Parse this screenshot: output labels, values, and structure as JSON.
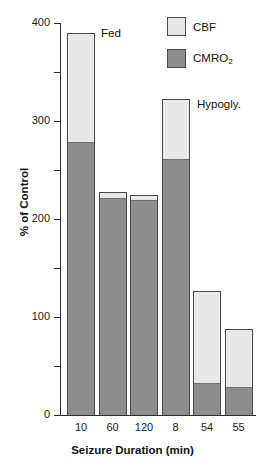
{
  "chart_data": {
    "type": "bar",
    "subtype": "stacked-bar",
    "title": "",
    "xlabel": "Seizure Duration (min)",
    "ylabel": "% of Control",
    "categories": [
      "10",
      "60",
      "120",
      "8",
      "54",
      "55"
    ],
    "series": [
      {
        "name": "CMRO2",
        "label": "CMRO2",
        "color": "#8e8e8e",
        "values": [
          280,
          222,
          220,
          262,
          34,
          30
        ]
      },
      {
        "name": "CBF",
        "label": "CBF",
        "color": "#e8e8e8",
        "values": [
          110,
          6,
          4,
          60,
          93,
          58
        ]
      }
    ],
    "totals": [
      390,
      228,
      224,
      322,
      127,
      88
    ],
    "ylim": [
      0,
      400
    ],
    "y_major_ticks": [
      0,
      100,
      200,
      300,
      400
    ],
    "y_major_tick_labels": [
      "0",
      "100",
      "200",
      "300",
      "400"
    ],
    "y_minor_ticks": [
      50,
      150,
      250,
      350
    ],
    "grid": false,
    "legend_position": "top-right",
    "annotations": [
      {
        "text": "Fed",
        "category": "10"
      },
      {
        "text": "Hypogly.",
        "category": "8"
      }
    ]
  },
  "axes": {
    "y": {
      "label": "% of Control",
      "ticks": [
        {
          "value": 400,
          "label": "400"
        },
        {
          "value": 350,
          "label": ""
        },
        {
          "value": 300,
          "label": "300"
        },
        {
          "value": 250,
          "label": ""
        },
        {
          "value": 200,
          "label": "200"
        },
        {
          "value": 150,
          "label": ""
        },
        {
          "value": 100,
          "label": "100"
        },
        {
          "value": 50,
          "label": ""
        },
        {
          "value": 0,
          "label": "0"
        }
      ]
    },
    "x": {
      "label": "Seizure Duration (min)",
      "ticks": [
        {
          "label": "10"
        },
        {
          "label": "60"
        },
        {
          "label": "120"
        },
        {
          "label": "8"
        },
        {
          "label": "54"
        },
        {
          "label": "55"
        }
      ]
    }
  },
  "legend": {
    "items": [
      {
        "label": "CBF",
        "sub": "",
        "color": "#e8e8e8"
      },
      {
        "label": "CMRO",
        "sub": "2",
        "color": "#8e8e8e"
      }
    ]
  },
  "annotations": {
    "fed": "Fed",
    "hypogly": "Hypogly."
  }
}
